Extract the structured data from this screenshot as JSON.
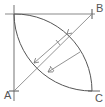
{
  "diagram": {
    "type": "geometric-construction",
    "points": {
      "A": {
        "label": "A",
        "x": 14,
        "y": 91
      },
      "B": {
        "label": "B",
        "x": 92,
        "y": 14
      },
      "C": {
        "label": "C",
        "x": 92,
        "y": 91
      }
    },
    "colors": {
      "line": "#6b6b6b",
      "arc": "#555555",
      "label": "#555555",
      "background": "#ffffff"
    }
  }
}
